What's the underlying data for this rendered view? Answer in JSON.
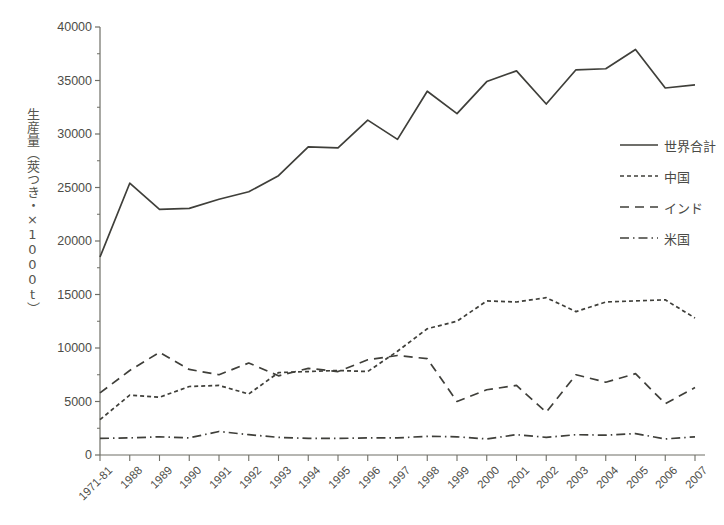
{
  "chart_data": {
    "type": "line",
    "title": "",
    "xlabel": "",
    "ylabel": "生産量（莢つき・×1000t）",
    "ylim": [
      0,
      40000
    ],
    "ytick_values": [
      0,
      5000,
      10000,
      15000,
      20000,
      25000,
      30000,
      35000,
      40000
    ],
    "ytick_labels": [
      "0",
      "5000",
      "10000",
      "15000",
      "20000",
      "25000",
      "30000",
      "35000",
      "40000"
    ],
    "grid": false,
    "legend_position": "right",
    "categories": [
      "1971-81",
      "1988",
      "1989",
      "1990",
      "1991",
      "1992",
      "1993",
      "1994",
      "1995",
      "1996",
      "1997",
      "1998",
      "1999",
      "2000",
      "2001",
      "2002",
      "2003",
      "2004",
      "2005",
      "2006",
      "2007"
    ],
    "series": [
      {
        "name": "世界合計",
        "style": "solid",
        "color": "#3f3f3a",
        "values": [
          18500,
          25400,
          22950,
          23050,
          23900,
          24600,
          26100,
          28800,
          28700,
          31300,
          29500,
          34000,
          31900,
          34900,
          35900,
          32800,
          36000,
          36100,
          37900,
          34300,
          34600
        ]
      },
      {
        "name": "中国",
        "style": "dotted",
        "color": "#3f3f3a",
        "values": [
          3300,
          5600,
          5400,
          6400,
          6500,
          5700,
          7700,
          7800,
          7900,
          7800,
          9700,
          11800,
          12500,
          14400,
          14300,
          14700,
          13400,
          14300,
          14400,
          14500,
          12800
        ]
      },
      {
        "name": "インド",
        "style": "dashed",
        "color": "#3f3f3a",
        "values": [
          5800,
          7900,
          9600,
          8000,
          7500,
          8600,
          7400,
          8100,
          7800,
          8900,
          9300,
          9000,
          5000,
          6100,
          6500,
          4000,
          7500,
          6800,
          7600,
          4800,
          6300
        ]
      },
      {
        "name": "米国",
        "style": "dashdot",
        "color": "#3f3f3a",
        "values": [
          1550,
          1600,
          1700,
          1600,
          2200,
          1900,
          1650,
          1550,
          1550,
          1600,
          1600,
          1750,
          1700,
          1500,
          1900,
          1650,
          1900,
          1850,
          2000,
          1500,
          1700
        ]
      }
    ]
  },
  "axis": {
    "y_label": "生産量（莢つき・×1000t）"
  },
  "legend": {
    "items": [
      {
        "label": "世界合計",
        "style": "solid"
      },
      {
        "label": "中国",
        "style": "dotted"
      },
      {
        "label": "インド",
        "style": "dashed"
      },
      {
        "label": "米国",
        "style": "dashdot"
      }
    ]
  }
}
